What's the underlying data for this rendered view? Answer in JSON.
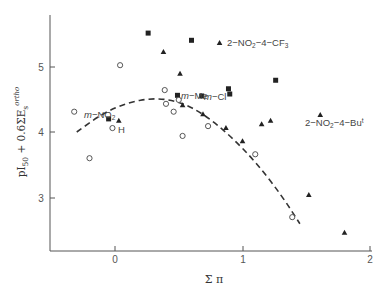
{
  "chart_data": {
    "type": "scatter",
    "title": "",
    "xlabel": "Σπ",
    "ylabel": "pI50 + 0.6ΣEs ortho",
    "xlim": [
      -0.5,
      2.0
    ],
    "ylim": [
      2.2,
      5.8
    ],
    "xticks": [
      "0",
      "1",
      "2"
    ],
    "yticks": [
      "3",
      "4",
      "5"
    ],
    "grid": false,
    "legend": "none",
    "series": [
      {
        "name": "squares",
        "marker": "filled-square",
        "x": [
          0.26,
          0.6,
          -0.05,
          0.49,
          0.68,
          0.89,
          0.9,
          1.26
        ],
        "y": [
          5.51,
          5.4,
          4.2,
          4.56,
          4.55,
          4.66,
          4.58,
          4.79
        ]
      },
      {
        "name": "triangles",
        "marker": "filled-triangle",
        "x": [
          0.82,
          0.38,
          0.51,
          0.03,
          0.53,
          0.69,
          0.87,
          1.0,
          1.15,
          1.22,
          1.61,
          1.52,
          1.8
        ],
        "y": [
          5.36,
          5.22,
          4.89,
          4.17,
          4.41,
          4.27,
          4.06,
          3.86,
          4.12,
          4.17,
          4.26,
          3.04,
          2.46
        ]
      },
      {
        "name": "circles",
        "marker": "open-circle",
        "x": [
          -0.32,
          0.04,
          -0.2,
          0.39,
          0.4,
          0.5,
          0.46,
          0.53,
          0.73,
          -0.02,
          1.1,
          1.39
        ],
        "y": [
          4.31,
          5.02,
          3.6,
          4.64,
          4.43,
          4.49,
          4.31,
          3.94,
          4.09,
          4.06,
          3.66,
          2.7
        ]
      }
    ],
    "fit_curve": {
      "style": "dashed",
      "type": "parabola",
      "x": [
        -0.3,
        -0.1,
        0.1,
        0.3,
        0.5,
        0.7,
        0.9,
        1.1,
        1.3,
        1.45
      ],
      "y": [
        4.0,
        4.28,
        4.45,
        4.52,
        4.47,
        4.27,
        3.95,
        3.55,
        3.05,
        2.6
      ]
    },
    "annotations": [
      {
        "text": "m-NO2",
        "x": 0.0,
        "y": 4.25
      },
      {
        "text": "H",
        "x": 0.02,
        "y": 4.03
      },
      {
        "text": "m-Me",
        "x": 0.53,
        "y": 4.78
      },
      {
        "text": "m-Cl",
        "x": 0.7,
        "y": 4.55
      },
      {
        "text": "2-NO2-4-CF3",
        "x": 0.85,
        "y": 5.36
      },
      {
        "text": "2-NO2-4-Bu t",
        "x": 1.6,
        "y": 4.1
      }
    ]
  },
  "labels": {
    "y_axis": "pI",
    "y_axis_sub": "50",
    "y_axis_rest": " + 0.6ΣE",
    "y_axis_sub2": "s",
    "y_axis_sup": "ortho",
    "x_axis": "Σ π",
    "tick_x0": "0",
    "tick_x1": "1",
    "tick_x2": "2",
    "tick_y3": "3",
    "tick_y4": "4",
    "tick_y5": "5",
    "ann_mno2_a": "m",
    "ann_mno2_b": "−NO",
    "ann_mno2_c": "2",
    "ann_h": "H",
    "ann_mme_a": "m",
    "ann_mme_b": "−Me",
    "ann_mcl_a": "m",
    "ann_mcl_b": "−Cl",
    "ann_cf3_a": "2−NO",
    "ann_cf3_b": "2",
    "ann_cf3_c": "−4−CF",
    "ann_cf3_d": "3",
    "ann_but_a": "2−NO",
    "ann_but_b": "2",
    "ann_but_c": "−4−Bu",
    "ann_but_d": "t"
  }
}
